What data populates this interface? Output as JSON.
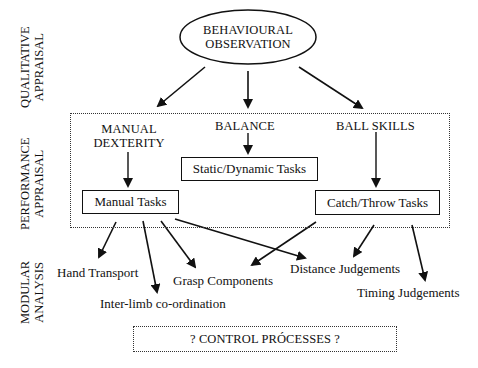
{
  "side_labels": {
    "qualitative": [
      "QUALITATIVE",
      "APPRAISAL"
    ],
    "performance": [
      "PERFORMANCE",
      "APPRAISAL"
    ],
    "modular": [
      "MODULAR",
      "ANALYSIS"
    ]
  },
  "root": {
    "line1": "BEHAVIOURAL",
    "line2": "OBSERVATION"
  },
  "categories": {
    "manual_dexterity": [
      "MANUAL",
      "DEXTERITY"
    ],
    "balance": "BALANCE",
    "ball_skills": "BALL SKILLS"
  },
  "tasks": {
    "manual": "Manual Tasks",
    "static_dynamic": "Static/Dynamic Tasks",
    "catch_throw": "Catch/Throw Tasks"
  },
  "components": {
    "hand_transport": "Hand Transport",
    "inter_limb": "Inter-limb co-ordination",
    "grasp": "Grasp Components",
    "distance": "Distance Judgements",
    "timing": "Timing Judgements"
  },
  "footer": {
    "control_processes": "? CONTROL PRÓCESSES ?"
  },
  "colors": {
    "ink": "#111111",
    "background": "#ffffff"
  }
}
